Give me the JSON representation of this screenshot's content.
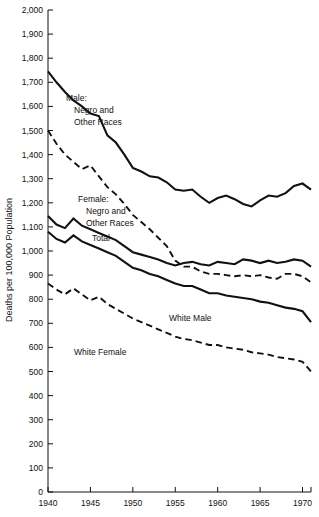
{
  "chart_data": {
    "type": "line",
    "title": "",
    "xlabel": "",
    "ylabel": "Deaths per 100,000 Population",
    "xlim": [
      1940,
      1971
    ],
    "ylim": [
      0,
      2000
    ],
    "ytick_step": 100,
    "xtick_step": 5,
    "grid": false,
    "legend": "inline-annotations",
    "ytick_labels": [
      "0",
      "100",
      "200",
      "300",
      "400",
      "500",
      "600",
      "700",
      "800",
      "900",
      "1,000",
      "1,100",
      "1,200",
      "1,300",
      "1,400",
      "1,500",
      "1,600",
      "1,700",
      "1,800",
      "1,900",
      "2,000"
    ],
    "xtick_labels": [
      "1940",
      "1945",
      "1950",
      "1955",
      "1960",
      "1965",
      "1970"
    ],
    "x": [
      1940,
      1941,
      1942,
      1943,
      1944,
      1945,
      1946,
      1947,
      1948,
      1949,
      1950,
      1951,
      1952,
      1953,
      1954,
      1955,
      1956,
      1957,
      1958,
      1959,
      1960,
      1961,
      1962,
      1963,
      1964,
      1965,
      1966,
      1967,
      1968,
      1969,
      1970,
      1971
    ],
    "series": [
      {
        "name": "Male: Negro and Other Races",
        "style": "solid",
        "values": [
          1745,
          1700,
          1660,
          1625,
          1600,
          1570,
          1560,
          1480,
          1450,
          1400,
          1345,
          1330,
          1310,
          1305,
          1285,
          1255,
          1250,
          1255,
          1225,
          1200,
          1220,
          1230,
          1215,
          1195,
          1185,
          1210,
          1230,
          1225,
          1240,
          1270,
          1280,
          1255
        ],
        "label_text": [
          "Male:",
          "Negro and",
          "Other Races"
        ],
        "label_pos": {
          "x": 66,
          "y": 101
        }
      },
      {
        "name": "Female: Negro and Other Races",
        "style": "dashed",
        "values": [
          1500,
          1445,
          1400,
          1370,
          1340,
          1355,
          1310,
          1265,
          1235,
          1195,
          1150,
          1120,
          1090,
          1055,
          1020,
          960,
          935,
          935,
          915,
          905,
          905,
          900,
          895,
          900,
          895,
          900,
          890,
          885,
          905,
          905,
          895,
          870
        ],
        "label_text": [
          "Female:",
          "Negro and",
          "Other Races"
        ],
        "label_pos": {
          "x": 78,
          "y": 202
        }
      },
      {
        "name": "Total",
        "style": "solid",
        "values": [
          1145,
          1110,
          1095,
          1135,
          1105,
          1090,
          1075,
          1060,
          1045,
          1020,
          995,
          985,
          975,
          965,
          950,
          940,
          950,
          955,
          945,
          940,
          955,
          950,
          945,
          965,
          960,
          950,
          960,
          950,
          955,
          965,
          960,
          935
        ],
        "label_text": [
          "Total"
        ],
        "label_pos": {
          "x": 92,
          "y": 241
        }
      },
      {
        "name": "White Male",
        "style": "solid",
        "values": [
          1080,
          1050,
          1035,
          1065,
          1040,
          1025,
          1010,
          995,
          980,
          955,
          930,
          920,
          905,
          895,
          880,
          865,
          855,
          855,
          840,
          825,
          825,
          815,
          810,
          805,
          800,
          790,
          785,
          775,
          765,
          760,
          750,
          705
        ],
        "label_text": [
          "White Male"
        ],
        "label_pos": {
          "x": 169,
          "y": 321
        }
      },
      {
        "name": "White Female",
        "style": "dashed",
        "values": [
          865,
          840,
          820,
          845,
          820,
          795,
          810,
          780,
          760,
          740,
          720,
          705,
          690,
          675,
          660,
          645,
          635,
          630,
          620,
          610,
          610,
          600,
          595,
          590,
          580,
          575,
          570,
          560,
          555,
          550,
          540,
          500
        ],
        "label_text": [
          "White Female"
        ],
        "label_pos": {
          "x": 74,
          "y": 355
        }
      }
    ]
  }
}
